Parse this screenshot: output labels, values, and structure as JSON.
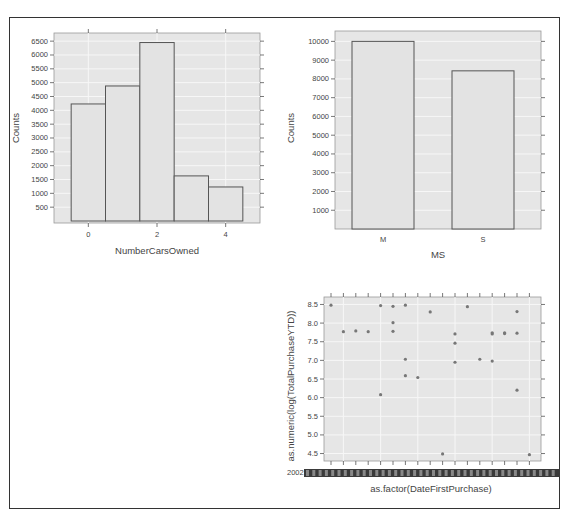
{
  "chart_data": [
    {
      "type": "bar",
      "title": "",
      "xlabel": "NumberCarsOwned",
      "ylabel": "Counts",
      "categories": [
        "0",
        "1",
        "2",
        "3",
        "4"
      ],
      "values": [
        4230,
        4880,
        6450,
        1630,
        1230
      ],
      "x_ticks": [
        "0",
        "2",
        "4"
      ],
      "y_ticks": [
        500,
        1000,
        1500,
        2000,
        2500,
        3000,
        3500,
        4000,
        4500,
        5000,
        5500,
        6000,
        6500
      ],
      "ylim": [
        0,
        6650
      ],
      "grid": true,
      "legend": null
    },
    {
      "type": "bar",
      "title": "",
      "xlabel": "MS",
      "ylabel": "Counts",
      "categories": [
        "M",
        "S"
      ],
      "values": [
        10000,
        8430
      ],
      "y_ticks": [
        1000,
        2000,
        3000,
        4000,
        5000,
        6000,
        7000,
        8000,
        9000,
        10000
      ],
      "ylim": [
        0,
        10500
      ],
      "grid": true,
      "legend": null
    },
    {
      "type": "scatter",
      "title": "",
      "xlabel": "as.factor(DateFirstPurchase)",
      "ylabel": "as.numeric(log(TotalPurchaseYTD))",
      "x_tick_label_visible_prefix": "2002",
      "x_category_count": 17,
      "y_ticks": [
        4.5,
        5.0,
        5.5,
        6.0,
        6.5,
        7.0,
        7.5,
        8.0,
        8.5
      ],
      "ylim": [
        4.3,
        8.7
      ],
      "grid": true,
      "points": [
        {
          "x": 1,
          "y": 8.48
        },
        {
          "x": 2,
          "y": 7.77
        },
        {
          "x": 3,
          "y": 7.79
        },
        {
          "x": 4,
          "y": 7.77
        },
        {
          "x": 5,
          "y": 8.47
        },
        {
          "x": 5,
          "y": 6.08
        },
        {
          "x": 6,
          "y": 8.45
        },
        {
          "x": 6,
          "y": 8.01
        },
        {
          "x": 6,
          "y": 7.78
        },
        {
          "x": 7,
          "y": 8.48
        },
        {
          "x": 7,
          "y": 7.03
        },
        {
          "x": 7,
          "y": 6.59
        },
        {
          "x": 8,
          "y": 6.54
        },
        {
          "x": 9,
          "y": 8.3
        },
        {
          "x": 10,
          "y": 4.49
        },
        {
          "x": 11,
          "y": 7.71
        },
        {
          "x": 11,
          "y": 7.46
        },
        {
          "x": 11,
          "y": 6.95
        },
        {
          "x": 12,
          "y": 8.44
        },
        {
          "x": 13,
          "y": 7.03
        },
        {
          "x": 14,
          "y": 7.74
        },
        {
          "x": 14,
          "y": 7.71
        },
        {
          "x": 14,
          "y": 6.98
        },
        {
          "x": 15,
          "y": 7.74
        },
        {
          "x": 15,
          "y": 7.72
        },
        {
          "x": 16,
          "y": 8.31
        },
        {
          "x": 16,
          "y": 7.73
        },
        {
          "x": 16,
          "y": 6.2
        },
        {
          "x": 17,
          "y": 4.47
        }
      ]
    }
  ],
  "labels": {
    "chart1_xlabel": "NumberCarsOwned",
    "chart1_ylabel": "Counts",
    "chart2_xlabel": "MS",
    "chart2_ylabel": "Counts",
    "chart3_xlabel": "as.factor(DateFirstPurchase)",
    "chart3_ylabel": "as.numeric(log(TotalPurchaseYTD))",
    "chart3_xtick_text": "2002"
  },
  "colors": {
    "panel_bg": "#e6e6e6",
    "grid": "#f7f7f7",
    "bar_fill": "#e3e3e3",
    "bar_stroke": "#555555",
    "point": "#777777",
    "frame": "#333333"
  }
}
